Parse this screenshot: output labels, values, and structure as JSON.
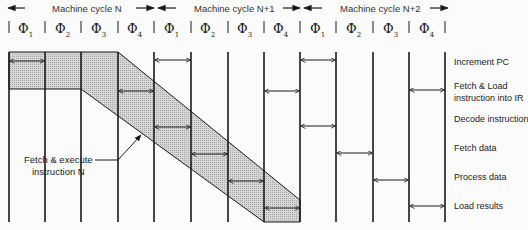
{
  "diagram": {
    "type": "instruction-pipeline-timing",
    "machine_cycles": [
      {
        "label": "Machine cycle N",
        "x": 52
      },
      {
        "label": "Machine cycle N+1",
        "x": 194
      },
      {
        "label": "Machine cycle N+2",
        "x": 340
      }
    ],
    "phase_symbol": "Φ",
    "phases": [
      {
        "sub": "1",
        "x": 18
      },
      {
        "sub": "2",
        "x": 55
      },
      {
        "sub": "3",
        "x": 91
      },
      {
        "sub": "4",
        "x": 127
      },
      {
        "sub": "1",
        "x": 164
      },
      {
        "sub": "2",
        "x": 200
      },
      {
        "sub": "3",
        "x": 237
      },
      {
        "sub": "4",
        "x": 273
      },
      {
        "sub": "1",
        "x": 310
      },
      {
        "sub": "2",
        "x": 346
      },
      {
        "sub": "3",
        "x": 383
      },
      {
        "sub": "4",
        "x": 419
      }
    ],
    "rows": [
      {
        "label": "Increment PC",
        "y": 56
      },
      {
        "label": "Fetch & Load",
        "label2": "instruction into IR",
        "y": 80
      },
      {
        "label": "Decode instruction",
        "y": 113
      },
      {
        "label": "Fetch data",
        "y": 142
      },
      {
        "label": "Process data",
        "y": 171
      },
      {
        "label": "Load results",
        "y": 200
      }
    ],
    "annotation": {
      "line1": "Fetch & execute",
      "line2": "instruction N"
    },
    "colors": {
      "line": "#1a1a1a",
      "shade": "#c9c9c9",
      "text": "#222222"
    }
  }
}
